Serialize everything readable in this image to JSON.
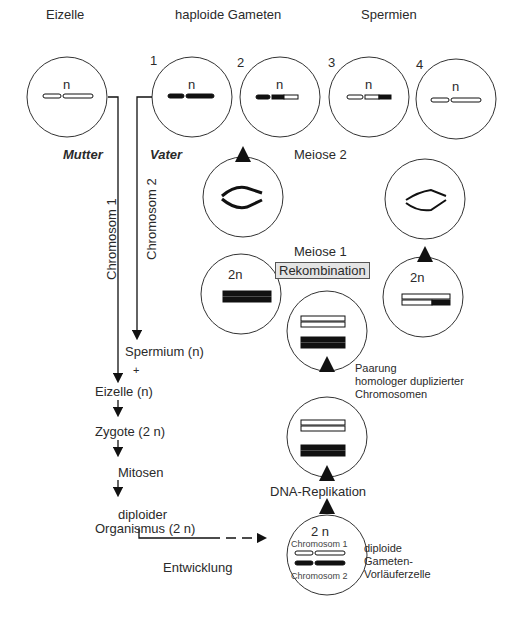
{
  "headers": {
    "eizelle": "Eizelle",
    "haploide_gameten": "haploide Gameten",
    "spermien": "Spermien"
  },
  "gamete_numbers": [
    "1",
    "2",
    "3",
    "4"
  ],
  "ploidy": {
    "n": "n",
    "two_n": "2n",
    "two_n_spaced": "2 n"
  },
  "parents": {
    "mother": "Mutter",
    "father": "Vater"
  },
  "lineage": {
    "chrom1": "Chromosom 1",
    "chrom2": "Chromosom 2"
  },
  "stages": {
    "meiose2": "Meiose 2",
    "meiose1": "Meiose 1",
    "rekombination": "Rekombination",
    "paarung": [
      "Paarung",
      "homologer duplizierter",
      "Chromosomen"
    ],
    "dna_replikation": "DNA-Replikation",
    "diploide": [
      "diploide",
      "Gameten-",
      "Vorläuferzelle"
    ]
  },
  "left_flow": {
    "spermium": "Spermium (n)",
    "plus": "+",
    "eizelle": "Eizelle (n)",
    "zygote": "Zygote (2 n)",
    "mitosen": "Mitosen",
    "diploider": "diploider",
    "organismus": "Organismus (2 n)",
    "entwicklung": "Entwicklung"
  },
  "precursor_labels": {
    "c1": "Chromosom 1",
    "c2": "Chromosom 2"
  }
}
